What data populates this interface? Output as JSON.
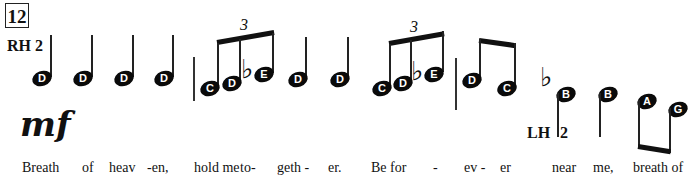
{
  "measure_number": "12",
  "right_hand_label": "RH 2",
  "left_hand_label": "LH",
  "left_hand_finger": "2",
  "dynamic": "mf",
  "triplet_marks": [
    "3",
    "3"
  ],
  "accidental": "♭",
  "notes": [
    {
      "name": "D"
    },
    {
      "name": "D"
    },
    {
      "name": "D"
    },
    {
      "name": "D"
    },
    {
      "name": "C"
    },
    {
      "name": "D"
    },
    {
      "name": "E"
    },
    {
      "name": "D"
    },
    {
      "name": "D"
    },
    {
      "name": "C"
    },
    {
      "name": "D"
    },
    {
      "name": "E"
    },
    {
      "name": "D"
    },
    {
      "name": "C"
    },
    {
      "name": "B"
    },
    {
      "name": "B"
    },
    {
      "name": "A"
    },
    {
      "name": "G"
    }
  ],
  "lyrics": [
    "Breath",
    "of",
    "heav",
    "-en,",
    "hold me",
    "to-",
    "geth -",
    "er.",
    "Be for",
    "-",
    "ev -",
    "er",
    "near",
    "me,",
    "breath of"
  ]
}
